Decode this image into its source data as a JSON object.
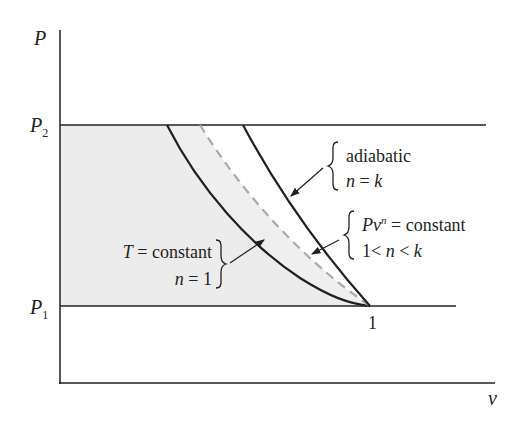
{
  "diagram": {
    "type": "P-v diagram of compression processes",
    "axes": {
      "y_label": "P",
      "x_label": "v",
      "y_ticks": [
        {
          "main": "P",
          "sub": "2"
        },
        {
          "main": "P",
          "sub": "1"
        }
      ],
      "x_tick": "1"
    },
    "processes": [
      {
        "name": "adiabatic",
        "line1": "adiabatic",
        "line2_var": "n",
        "line2_rest": " = ",
        "line2_val": "k",
        "style": "solid"
      },
      {
        "name": "polytropic",
        "line1_var": "Pv",
        "line1_sup": "n",
        "line1_rest": " = constant",
        "line2_pre": "1< ",
        "line2_var": "n",
        "line2_mid": " < ",
        "line2_val": "k",
        "style": "dashed"
      },
      {
        "name": "isothermal",
        "line1_var": "T",
        "line1_rest": " = constant",
        "line2_var": "n",
        "line2_rest": " = 1",
        "style": "solid"
      }
    ],
    "colors": {
      "line": "#231f20",
      "dashed": "#a7a9ac",
      "shade": "#ececec"
    }
  }
}
